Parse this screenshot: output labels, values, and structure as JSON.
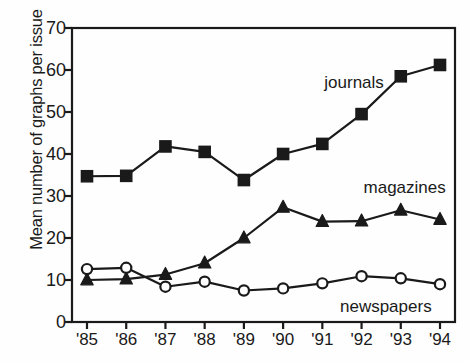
{
  "chart_data": {
    "type": "line",
    "title": "",
    "xlabel": "",
    "ylabel": "Mean number of graphs per issue",
    "categories": [
      "'85",
      "'86",
      "'87",
      "'88",
      "'89",
      "'90",
      "'91",
      "'92",
      "'93",
      "'94"
    ],
    "xlim": [
      0,
      9
    ],
    "ylim": [
      0,
      70
    ],
    "yticks": [
      0,
      10,
      20,
      30,
      40,
      50,
      60,
      70
    ],
    "grid": false,
    "legend_position": "inline-annotations",
    "series": [
      {
        "name": "journals",
        "marker": "filled-square",
        "color": "#1a1a1a",
        "values": [
          34.7,
          34.8,
          41.8,
          40.5,
          33.8,
          40.0,
          42.4,
          49.5,
          58.5,
          61.2
        ]
      },
      {
        "name": "magazines",
        "marker": "filled-triangle",
        "color": "#1a1a1a",
        "values": [
          10.0,
          10.2,
          11.3,
          14.0,
          20.0,
          27.3,
          23.9,
          24.0,
          26.6,
          24.4
        ]
      },
      {
        "name": "newspapers",
        "marker": "open-circle",
        "color": "#1a1a1a",
        "values": [
          12.6,
          12.9,
          8.4,
          9.6,
          7.5,
          8.0,
          9.2,
          10.9,
          10.4,
          9.0
        ]
      }
    ],
    "annotations": [
      {
        "text": "journals",
        "x": 6.05,
        "y": 57.0
      },
      {
        "text": "magazines",
        "x": 7.05,
        "y": 32.0
      },
      {
        "text": "newspapers",
        "x": 6.45,
        "y": 3.6
      }
    ]
  },
  "axis_color": "#1a1a1a",
  "background": "#ffffff"
}
